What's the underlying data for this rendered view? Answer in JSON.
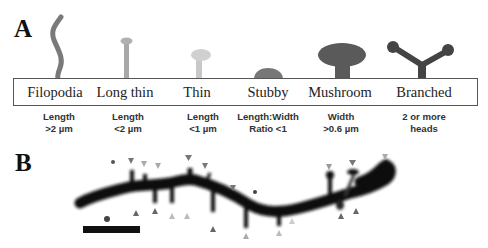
{
  "panel_a": {
    "letter": "A",
    "spine_types": [
      {
        "name": "Filopodia",
        "criterion": [
          "Length",
          ">2 µm"
        ],
        "color": "#7a7a7a"
      },
      {
        "name": "Long thin",
        "criterion": [
          "Length",
          "<2 µm"
        ],
        "color": "#a8a8a8"
      },
      {
        "name": "Thin",
        "criterion": [
          "Length",
          "<1 µm"
        ],
        "color": "#c8c8c8"
      },
      {
        "name": "Stubby",
        "criterion": [
          "Length:Width",
          "Ratio <1"
        ],
        "color": "#777777"
      },
      {
        "name": "Mushroom",
        "criterion": [
          "Width",
          ">0.6 µm"
        ],
        "color": "#5a5a5a"
      },
      {
        "name": "Branched",
        "criterion": [
          "2 or more",
          "heads"
        ],
        "color": "#444444"
      }
    ]
  },
  "panel_b": {
    "letter": "B",
    "description": "Dendrite segment with spines marked by arrowheads",
    "scale_bar": true
  }
}
